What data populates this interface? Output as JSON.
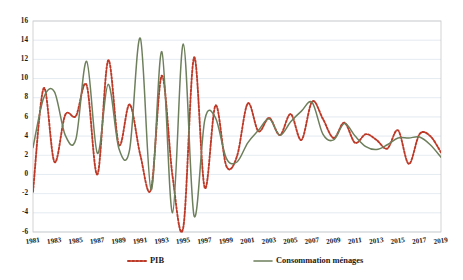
{
  "chart_data": {
    "type": "line",
    "title": "",
    "subtitle": "",
    "xlabel": "",
    "ylabel": "",
    "ylim": [
      -6,
      16
    ],
    "ytick_step": 2,
    "yticks": [
      -6,
      -4,
      -2,
      0,
      2,
      4,
      6,
      8,
      10,
      12,
      14,
      16
    ],
    "xlim": [
      1981,
      2019
    ],
    "xticks": [
      1981,
      1983,
      1985,
      1987,
      1989,
      1991,
      1993,
      1995,
      1997,
      1999,
      2001,
      2003,
      2005,
      2007,
      2009,
      2011,
      2013,
      2015,
      2017,
      2019
    ],
    "x": [
      1981,
      1982,
      1983,
      1984,
      1985,
      1986,
      1987,
      1988,
      1989,
      1990,
      1991,
      1992,
      1993,
      1994,
      1995,
      1996,
      1997,
      1998,
      1999,
      2000,
      2001,
      2002,
      2003,
      2004,
      2005,
      2006,
      2007,
      2008,
      2009,
      2010,
      2011,
      2012,
      2013,
      2014,
      2015,
      2016,
      2017,
      2018,
      2019
    ],
    "grid": true,
    "grid_axis": "y",
    "legend_position": "bottom",
    "smoothing": "spline",
    "series": [
      {
        "name": "PIB",
        "color": "#BE3A28",
        "style": "dotted",
        "values": [
          -1.8,
          9.0,
          1.3,
          6.2,
          6.1,
          9.3,
          0.0,
          11.9,
          3.1,
          7.3,
          2.0,
          -1.5,
          10.3,
          -0.2,
          -5.5,
          12.2,
          -1.4,
          7.2,
          0.9,
          1.9,
          7.4,
          4.5,
          5.9,
          4.1,
          6.3,
          3.6,
          7.6,
          5.8,
          3.8,
          5.4,
          3.3,
          4.2,
          3.6,
          2.7,
          4.6,
          1.1,
          4.2,
          4.0,
          2.3
        ]
      },
      {
        "name": "Consommation ménages",
        "color": "#6E7F5C",
        "style": "solid",
        "values": [
          2.8,
          8.0,
          8.6,
          4.1,
          3.7,
          11.8,
          2.2,
          9.4,
          2.7,
          2.6,
          14.2,
          -1.6,
          12.8,
          -4.0,
          13.6,
          -4.3,
          5.7,
          5.9,
          1.7,
          1.3,
          3.3,
          4.6,
          5.8,
          4.1,
          5.5,
          6.6,
          7.5,
          4.2,
          3.6,
          5.3,
          4.0,
          2.9,
          2.6,
          3.1,
          3.8,
          3.8,
          3.9,
          3.1,
          1.8
        ]
      }
    ]
  },
  "legend": {
    "items": [
      {
        "label": "PIB",
        "color": "#BE3A28",
        "style": "dotted"
      },
      {
        "label": "Consommation ménages",
        "color": "#6E7F5C",
        "style": "solid"
      }
    ]
  }
}
